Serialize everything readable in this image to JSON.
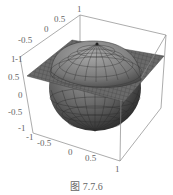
{
  "figure": {
    "caption": "图 7.7.6"
  },
  "axes": {
    "back_axis_ticks": [
      "-1",
      "-0.5",
      "0",
      "0.5",
      "1"
    ],
    "vertical_axis_ticks": [
      "1",
      "0.5",
      "0",
      "-0.5",
      "-1"
    ],
    "front_axis_ticks": [
      "-1",
      "-0.5",
      "0",
      "0.5",
      "1"
    ]
  },
  "surfaces": [
    {
      "name": "sphere",
      "shape": "unit sphere",
      "color": "#6e6e6e"
    },
    {
      "name": "plane",
      "shape": "horizontal plane z≈0.5",
      "color": "#5a5a5a"
    }
  ]
}
